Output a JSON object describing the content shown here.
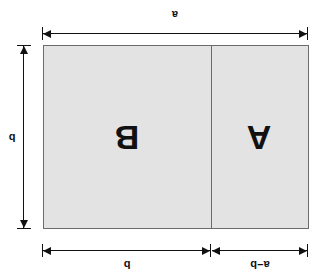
{
  "figure": {
    "orientation_note": "rotated-180",
    "background_color": "#ffffff",
    "fill_color": "#e3e3e3",
    "stroke_color": "#6b6b6b",
    "dimension_color": "#111111"
  },
  "regions": [
    {
      "id": "left",
      "label": "A",
      "width_label": "a−b"
    },
    {
      "id": "right",
      "label": "B",
      "width_label": "b"
    }
  ],
  "dimensions": {
    "top_left_segment": "a−b",
    "top_right_segment": "b",
    "right_vertical": "b",
    "bottom_total": "a"
  }
}
